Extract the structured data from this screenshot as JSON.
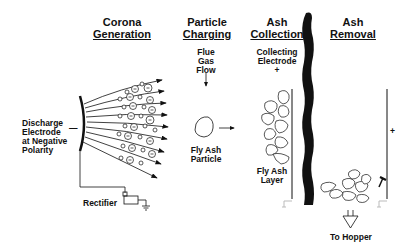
{
  "diagram": {
    "stages": [
      {
        "line1": "Corona",
        "line2": "Generation"
      },
      {
        "line1": "Particle",
        "line2": "Charging"
      },
      {
        "line1": "Ash",
        "line2": "Collection"
      },
      {
        "line1": "Ash",
        "line2": "Removal"
      }
    ],
    "labels": {
      "discharge": [
        "Discharge",
        "Electrode",
        "at Negative",
        "Polarity"
      ],
      "discharge_sign": "—",
      "rectifier": "Rectifier",
      "flue_gas": [
        "Flue",
        "Gas",
        "Flow"
      ],
      "fly_ash_particle": [
        "Fly Ash",
        "Particle"
      ],
      "collecting_electrode": [
        "Collecting",
        "Electrode"
      ],
      "collecting_sign": "+",
      "fly_ash_layer": [
        "Fly Ash",
        "Layer"
      ],
      "removal_sign": "+",
      "to_hopper": "To Hopper"
    },
    "colors": {
      "ink": "#111111",
      "background": "#ffffff",
      "ground": "#bbbbbb"
    }
  }
}
